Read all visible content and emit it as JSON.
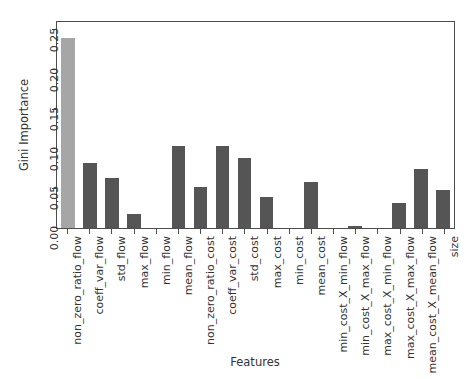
{
  "chart_data": {
    "type": "bar",
    "title": "",
    "xlabel": "Features",
    "ylabel": "Gini Importance",
    "ylim": [
      0.0,
      0.26
    ],
    "yticks": [
      "0.00",
      "0.05",
      "0.10",
      "0.15",
      "0.20",
      "0.25"
    ],
    "ytick_values": [
      0.0,
      0.05,
      0.1,
      0.15,
      0.2,
      0.25
    ],
    "grid": false,
    "legend": "none",
    "bar_color": "#555555",
    "highlight_color": "#a6a6a6",
    "highlight_index": 0,
    "categories": [
      "non_zero_ratio_flow",
      "coeff_var_flow",
      "std_flow",
      "max_flow",
      "min_flow",
      "mean_flow",
      "non_zero_ratio_cost",
      "coeff_var_cost",
      "std_cost",
      "max_cost",
      "min_cost",
      "mean_cost",
      "min_cost_X_min_flow",
      "min_cost_X_max_flow",
      "max_cost_X_min_flow",
      "max_cost_X_max_flow",
      "mean_cost_X_mean_flow",
      "size"
    ],
    "values": [
      0.24,
      0.082,
      0.063,
      0.018,
      0.0,
      0.104,
      0.052,
      0.104,
      0.089,
      0.039,
      0.0,
      0.058,
      0.0,
      0.002,
      0.0,
      0.031,
      0.074,
      0.048
    ]
  }
}
